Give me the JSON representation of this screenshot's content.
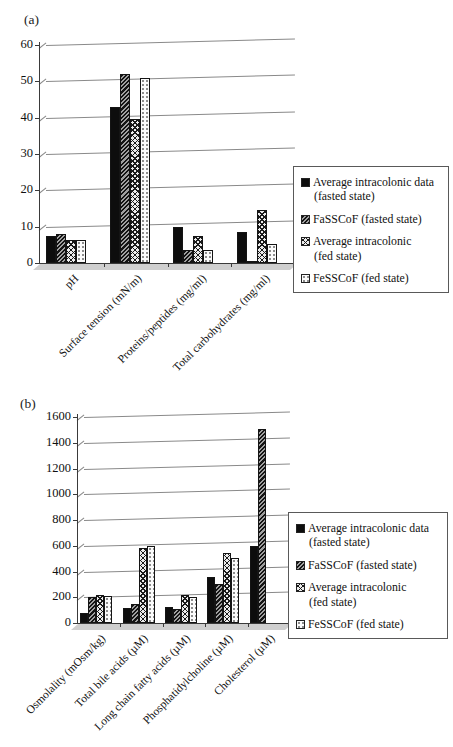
{
  "panels": [
    {
      "tag": "(a)"
    },
    {
      "tag": "(b)"
    }
  ],
  "legend": {
    "entries": [
      {
        "line1": "Average intracolonic data",
        "line2": "(fasted state)",
        "pattern": "solid-black"
      },
      {
        "line1": "FaSSCoF (fasted state)",
        "line2": "",
        "pattern": "diagonal-hatch"
      },
      {
        "line1": "Average intracolonic",
        "line2": "(fed state)",
        "pattern": "cross-hatch"
      },
      {
        "line1": "FeSSCoF (fed state)",
        "line2": "",
        "pattern": "dot-pattern"
      }
    ]
  },
  "colors": {
    "bar_black": "#0d0d0d",
    "axis": "#3a3a3a",
    "gridline": "#8a8a8a",
    "legend_border": "#595959",
    "background": "#ffffff"
  },
  "chart_data": [
    {
      "type": "bar",
      "panel": "(a)",
      "title": "",
      "xlabel": "",
      "ylabel": "",
      "ylim": [
        0,
        60
      ],
      "yticks": [
        0,
        10,
        20,
        30,
        40,
        50,
        60
      ],
      "grid": true,
      "legend_position": "right",
      "categories": [
        "pH",
        "Surface tension (mN/m)",
        "Proteins/peptides (mg/ml)",
        "Total carbohydrates (mg/ml)"
      ],
      "series": [
        {
          "name": "Average intracolonic data (fasted state)",
          "values": [
            7.5,
            43,
            9.8,
            8.5
          ]
        },
        {
          "name": "FaSSCoF (fasted state)",
          "values": [
            7.9,
            52,
            3.5,
            0.5
          ]
        },
        {
          "name": "Average intracolonic (fed state)",
          "values": [
            6.3,
            39.5,
            7.3,
            14.5
          ]
        },
        {
          "name": "FeSSCoF (fed state)",
          "values": [
            6.2,
            51,
            3.5,
            5.2
          ]
        }
      ]
    },
    {
      "type": "bar",
      "panel": "(b)",
      "title": "",
      "xlabel": "",
      "ylabel": "",
      "ylim": [
        0,
        1600
      ],
      "yticks": [
        0,
        200,
        400,
        600,
        800,
        1000,
        1200,
        1400,
        1600
      ],
      "grid": true,
      "legend_position": "right",
      "categories": [
        "Osmolality (mOsm/kg)",
        "Total bile acids (µM)",
        "Long chain fatty acids (µM)",
        "Phosphatidylcholine (µM)",
        "Cholesterol (µM)"
      ],
      "series": [
        {
          "name": "Average intracolonic data (fasted state)",
          "values": [
            80,
            115,
            125,
            360,
            600
          ]
        },
        {
          "name": "FaSSCoF (fasted state)",
          "values": [
            200,
            150,
            105,
            300,
            1510
          ]
        },
        {
          "name": "Average intracolonic (fed state)",
          "values": [
            220,
            580,
            220,
            540,
            0
          ]
        },
        {
          "name": "FeSSCoF (fed state)",
          "values": [
            210,
            600,
            205,
            505,
            0
          ]
        }
      ]
    }
  ]
}
